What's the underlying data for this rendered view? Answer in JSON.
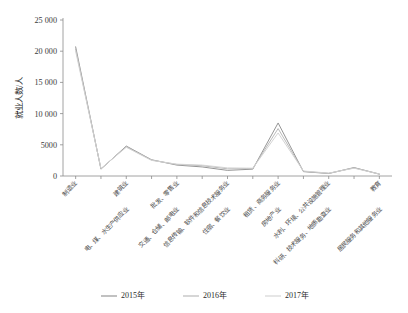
{
  "chart_data": {
    "type": "line",
    "title": "",
    "xlabel": "",
    "ylabel": "就业人数/人",
    "ylim": [
      0,
      25000
    ],
    "ytick_labels": [
      "0",
      "5000",
      "10 000",
      "15 000",
      "20 000",
      "25 000"
    ],
    "ytick_values": [
      0,
      5000,
      10000,
      15000,
      20000,
      25000
    ],
    "grid": false,
    "legend_position": "bottom-center",
    "categories": [
      "制造业",
      "电、煤、水生产供应业",
      "建筑业",
      "交通、仓储、邮电业",
      "批发、零售业",
      "住宿、餐饮业",
      "信息传输、软件和信息技术服务业",
      "房地产业",
      "租赁、商务服务业",
      "科研、技术服务、地质勘查业",
      "水利、环境、公共设施管理业",
      "居民服务和其他服务业",
      "教育"
    ],
    "series": [
      {
        "name": "2015年",
        "color": "#8f8f8f",
        "values": [
          20700,
          1100,
          4800,
          2600,
          1750,
          1450,
          900,
          1100,
          8500,
          700,
          400,
          1350,
          300
        ]
      },
      {
        "name": "2016年",
        "color": "#b5b5b5",
        "values": [
          20350,
          1150,
          4700,
          2550,
          1850,
          1650,
          1150,
          1200,
          7600,
          750,
          430,
          1300,
          310
        ]
      },
      {
        "name": "2017年",
        "color": "#d2d2d2",
        "values": [
          20000,
          1200,
          4600,
          2500,
          1900,
          1750,
          1300,
          1250,
          6900,
          800,
          460,
          1250,
          320
        ]
      }
    ]
  },
  "legend": {
    "items": [
      {
        "label": "2015年",
        "color": "#8f8f8f"
      },
      {
        "label": "2016年",
        "color": "#b5b5b5"
      },
      {
        "label": "2017年",
        "color": "#d2d2d2"
      }
    ]
  }
}
